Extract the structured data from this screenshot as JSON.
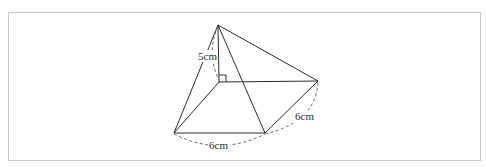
{
  "figure": {
    "labels": {
      "height": "5cm",
      "base_front": "6cm",
      "base_side": "6cm"
    },
    "vertices": {
      "apex": [
        218,
        25
      ],
      "foot": [
        219,
        82
      ],
      "back_right": [
        318,
        81
      ],
      "front_left": [
        174,
        133
      ],
      "front_right": [
        265,
        133
      ]
    },
    "colors": {
      "line": "#2a2a2a",
      "dashed": "#555555",
      "frame": "#c8c8c8",
      "background": "#ffffff"
    }
  }
}
